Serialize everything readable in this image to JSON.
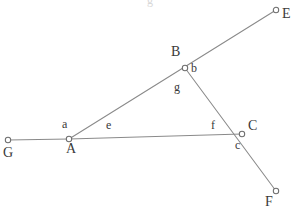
{
  "figure": {
    "background_color": "#ffffff",
    "line_color": "#8a8a8a",
    "vertex_fill": "#ffffff",
    "vertex_stroke": "#6e6e6e",
    "label_color": "#3a3a3a",
    "width": 296,
    "height": 213
  },
  "points": [
    {
      "id": "G",
      "label": "G",
      "x": 8,
      "y": 140,
      "label_x": 3,
      "label_y": 146,
      "kind": "endpoint"
    },
    {
      "id": "A",
      "label": "A",
      "x": 69,
      "y": 139,
      "label_x": 66,
      "label_y": 142,
      "kind": "vertex"
    },
    {
      "id": "B",
      "label": "B",
      "x": 185,
      "y": 68,
      "label_x": 171,
      "label_y": 45,
      "kind": "vertex"
    },
    {
      "id": "C",
      "label": "C",
      "x": 242,
      "y": 134,
      "label_x": 248,
      "label_y": 119,
      "kind": "vertex"
    },
    {
      "id": "E",
      "label": "E",
      "x": 276,
      "y": 10,
      "label_x": 282,
      "label_y": 7,
      "kind": "endpoint"
    },
    {
      "id": "F",
      "label": "F",
      "x": 276,
      "y": 191,
      "label_x": 265,
      "label_y": 195,
      "kind": "endpoint"
    }
  ],
  "segments": [
    {
      "id": "GA",
      "from": "G",
      "to": "A",
      "name": "segment-g-to-a"
    },
    {
      "id": "ABE",
      "from": "A",
      "to": "E",
      "name": "segment-a-through-b-to-e"
    },
    {
      "id": "BCF",
      "from": "B",
      "to": "F",
      "name": "segment-b-through-c-to-f"
    },
    {
      "id": "AC",
      "from": "A",
      "to": "C",
      "name": "segment-a-to-c"
    }
  ],
  "angle_labels": [
    {
      "id": "a",
      "text": "a",
      "x": 62,
      "y": 118,
      "at": "A",
      "size": "minor"
    },
    {
      "id": "b",
      "text": "b",
      "x": 191,
      "y": 62,
      "at": "B",
      "size": "minor"
    },
    {
      "id": "c",
      "text": "c",
      "x": 235,
      "y": 139,
      "at": "C",
      "size": "minor"
    }
  ],
  "side_labels": [
    {
      "id": "e",
      "text": "e",
      "x": 106,
      "y": 119,
      "on": "AC",
      "size": "minor"
    },
    {
      "id": "f",
      "text": "f",
      "x": 211,
      "y": 119,
      "on": "AC",
      "size": "minor"
    },
    {
      "id": "g",
      "text": "g",
      "x": 174,
      "y": 81,
      "on": "BC",
      "size": "minor"
    }
  ],
  "artifacts": [
    {
      "id": "top-clipped-glyph",
      "text": "g",
      "x": 147,
      "y": -6,
      "size": "faint"
    }
  ]
}
